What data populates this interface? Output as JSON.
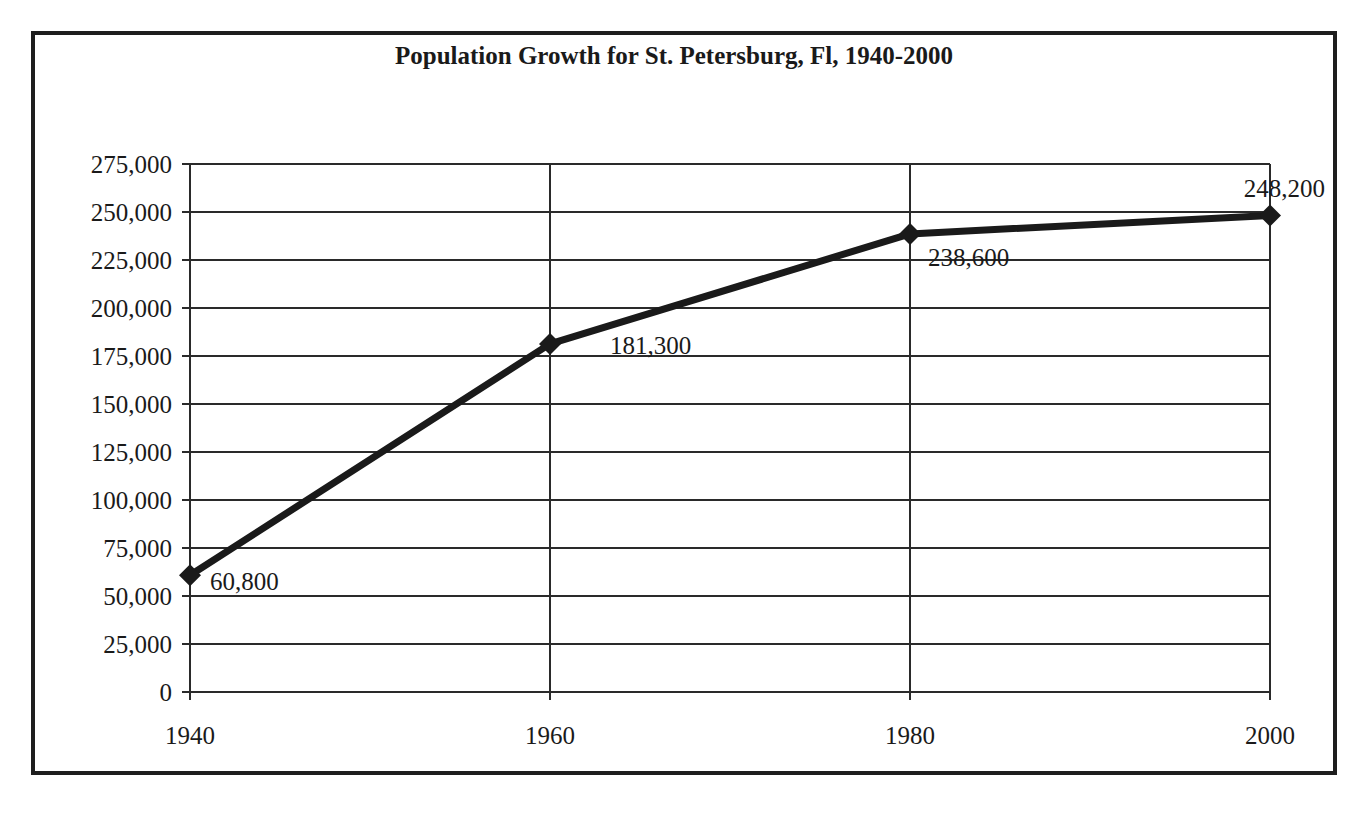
{
  "chart_data": {
    "type": "line",
    "title": "Population Growth for St. Petersburg, Fl, 1940-2000",
    "xlabel": "",
    "ylabel": "",
    "categories": [
      "1940",
      "1960",
      "1980",
      "2000"
    ],
    "series": [
      {
        "name": "Population",
        "values": [
          60800,
          181300,
          238600,
          248200
        ],
        "data_labels": [
          "60,800",
          "181,300",
          "238,600",
          "248,200"
        ],
        "marker": "diamond",
        "color": "#1a1a1a"
      }
    ],
    "yticks": [
      "0",
      "25,000",
      "50,000",
      "75,000",
      "100,000",
      "125,000",
      "150,000",
      "175,000",
      "200,000",
      "225,000",
      "250,000",
      "275,000"
    ],
    "ylim": [
      0,
      275000
    ],
    "grid": true,
    "legend": "none"
  },
  "colors": {
    "line": "#1a1a1a",
    "grid": "#2a2a2a",
    "background": "#ffffff",
    "frame": "#1e1e1e"
  }
}
